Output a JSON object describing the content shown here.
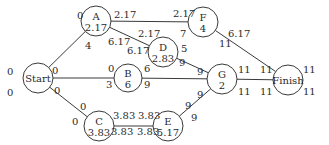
{
  "diagram": {
    "type": "activity-network",
    "nodes": [
      {
        "id": "Start",
        "name": "Start",
        "duration": "",
        "x": 38,
        "y": 78,
        "r": 15,
        "es": "0",
        "ef": "0",
        "ls": "0",
        "lf": "0"
      },
      {
        "id": "A",
        "name": "A",
        "duration": "2.17",
        "x": 96,
        "y": 21,
        "r": 15,
        "es": "0",
        "ef": "2.17",
        "ls": "4",
        "lf": "6.17"
      },
      {
        "id": "B",
        "name": "B",
        "duration": "6",
        "x": 128,
        "y": 78,
        "r": 14,
        "es": "0",
        "ef": "6",
        "ls": "3",
        "lf": "9"
      },
      {
        "id": "C",
        "name": "C",
        "duration": "3.83",
        "x": 99,
        "y": 126,
        "r": 15,
        "es": "0",
        "ef": "3.83",
        "ls": "0",
        "lf": "3.83"
      },
      {
        "id": "D",
        "name": "D",
        "duration": "2.83",
        "x": 163,
        "y": 52,
        "r": 15,
        "es": "2.17",
        "ef": "5",
        "ls": "6.17",
        "lf": "9"
      },
      {
        "id": "E",
        "name": "E",
        "duration": "5.17",
        "x": 168,
        "y": 126,
        "r": 15,
        "es": "3.83",
        "ef": "9",
        "ls": "3.83",
        "lf": "9"
      },
      {
        "id": "F",
        "name": "F",
        "duration": "4",
        "x": 203,
        "y": 22,
        "r": 15,
        "es": "2.17",
        "ef": "6.17",
        "ls": "7",
        "lf": "11"
      },
      {
        "id": "G",
        "name": "G",
        "duration": "2",
        "x": 222,
        "y": 79,
        "r": 15,
        "es": "9",
        "ef": "11",
        "ls": "9",
        "lf": "11"
      },
      {
        "id": "Finish",
        "name": "Finish",
        "duration": "",
        "x": 288,
        "y": 80,
        "r": 15,
        "es": "11",
        "ef": "11",
        "ls": "11",
        "lf": "11"
      }
    ],
    "edges": [
      {
        "from": "Start",
        "to": "A"
      },
      {
        "from": "Start",
        "to": "B"
      },
      {
        "from": "Start",
        "to": "C"
      },
      {
        "from": "A",
        "to": "F"
      },
      {
        "from": "A",
        "to": "D"
      },
      {
        "from": "D",
        "to": "G"
      },
      {
        "from": "B",
        "to": "G"
      },
      {
        "from": "C",
        "to": "E"
      },
      {
        "from": "E",
        "to": "G"
      },
      {
        "from": "F",
        "to": "Finish"
      },
      {
        "from": "G",
        "to": "Finish"
      }
    ],
    "labels": [
      {
        "text": "0",
        "x": 7,
        "y": 75
      },
      {
        "text": "0",
        "x": 7,
        "y": 96
      },
      {
        "text": "0",
        "x": 52,
        "y": 74
      },
      {
        "text": "0",
        "x": 54,
        "y": 94
      },
      {
        "text": "0",
        "x": 77,
        "y": 19
      },
      {
        "text": "2.17",
        "x": 114,
        "y": 18
      },
      {
        "text": "4",
        "x": 85,
        "y": 49
      },
      {
        "text": "6.17",
        "x": 108,
        "y": 45
      },
      {
        "text": "2.17",
        "x": 138,
        "y": 37
      },
      {
        "text": "6.17",
        "x": 127,
        "y": 54
      },
      {
        "text": "5",
        "x": 181,
        "y": 52
      },
      {
        "text": "9",
        "x": 179,
        "y": 66
      },
      {
        "text": "2.17",
        "x": 173,
        "y": 17
      },
      {
        "text": "7",
        "x": 180,
        "y": 37
      },
      {
        "text": "6.17",
        "x": 228,
        "y": 37
      },
      {
        "text": "11",
        "x": 219,
        "y": 47
      },
      {
        "text": "0",
        "x": 108,
        "y": 72
      },
      {
        "text": "3",
        "x": 106,
        "y": 88
      },
      {
        "text": "6",
        "x": 144,
        "y": 72
      },
      {
        "text": "9",
        "x": 144,
        "y": 88
      },
      {
        "text": "0",
        "x": 80,
        "y": 110
      },
      {
        "text": "0",
        "x": 72,
        "y": 125
      },
      {
        "text": "3.83",
        "x": 113,
        "y": 119
      },
      {
        "text": "3.83",
        "x": 111,
        "y": 135
      },
      {
        "text": "3.83",
        "x": 138,
        "y": 119
      },
      {
        "text": "3.83",
        "x": 137,
        "y": 135
      },
      {
        "text": "9",
        "x": 185,
        "y": 109
      },
      {
        "text": "9",
        "x": 191,
        "y": 121
      },
      {
        "text": "9",
        "x": 197,
        "y": 75
      },
      {
        "text": "9",
        "x": 197,
        "y": 98
      },
      {
        "text": "11",
        "x": 238,
        "y": 73
      },
      {
        "text": "11",
        "x": 238,
        "y": 95
      },
      {
        "text": "11",
        "x": 260,
        "y": 73
      },
      {
        "text": "11",
        "x": 260,
        "y": 95
      },
      {
        "text": "11",
        "x": 303,
        "y": 73
      },
      {
        "text": "11",
        "x": 303,
        "y": 95
      }
    ]
  }
}
